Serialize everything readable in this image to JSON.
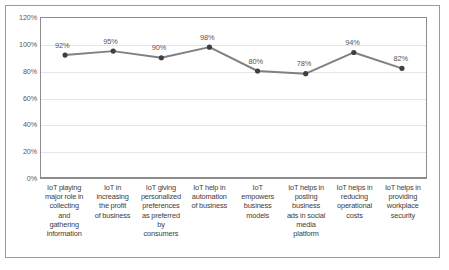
{
  "chart_data": {
    "type": "line",
    "title": "",
    "xlabel": "",
    "ylabel": "",
    "ylim": [
      0,
      120
    ],
    "y_tick_step": 20,
    "grid": true,
    "legend": "none",
    "y_ticks": [
      "0%",
      "20%",
      "40%",
      "60%",
      "80%",
      "100%",
      "120%"
    ],
    "y_tick_values": [
      0,
      20,
      40,
      60,
      80,
      100,
      120
    ],
    "categories": [
      "IoT playing major role in collecting and gathering information",
      "IoT in increasing the profit of business",
      "IoT giving personalized preferences as preferred by consumers",
      "IoT help in automation of business",
      "IoT empowers business models",
      "IoT helps in posting business ads in social media platform",
      "IoT helps in reducing operational costs",
      "IoT helps in providing workplace security"
    ],
    "values": [
      92,
      95,
      90,
      98,
      80,
      78,
      94,
      82
    ],
    "data_labels": [
      "92%",
      "95%",
      "90%",
      "98%",
      "80%",
      "78%",
      "94%",
      "82%"
    ],
    "series_name": "",
    "colors": {
      "line": "#808080",
      "marker": "#3f3f3f",
      "gridline": "#e6e6e6",
      "plot_border": "#8c8c8c",
      "outer_border": "#9a9a9a",
      "axis_text": "#5a5a5a",
      "label_text": "#3d3d3d",
      "data_label_text": "#555555",
      "background": "#ffffff"
    }
  },
  "categories_lines": [
    [
      "IoT playing",
      "major role in",
      "collecting",
      "and",
      "gathering",
      "information"
    ],
    [
      "IoT in",
      "increasing",
      "the profit",
      "of business"
    ],
    [
      "IoT giving",
      "personalized",
      "preferences",
      "as preferred",
      "by",
      "consumers"
    ],
    [
      "IoT help in",
      "automation",
      "of business"
    ],
    [
      "IoT",
      "empowers",
      "business",
      "models"
    ],
    [
      "IoT helps in",
      "posting",
      "business",
      "ads in social",
      "media",
      "platform"
    ],
    [
      "IoT helps in",
      "reducing",
      "operational",
      "costs"
    ],
    [
      "IoT helps in",
      "providing",
      "workplace",
      "security"
    ]
  ]
}
